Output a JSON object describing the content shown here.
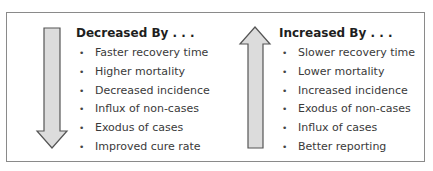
{
  "diagram": {
    "left_panel": {
      "arrow": "down-arrow",
      "heading": "Decreased By . . .",
      "items": [
        "Faster recovery time",
        "Higher mortality",
        "Decreased incidence",
        "Influx of non-cases",
        "Exodus of cases",
        "Improved cure rate"
      ]
    },
    "right_panel": {
      "arrow": "up-arrow",
      "heading": "Increased By . . .",
      "items": [
        "Slower recovery time",
        "Lower mortality",
        "Increased incidence",
        "Exodus of non-cases",
        "Influx of cases",
        "Better reporting"
      ]
    },
    "colors": {
      "arrow_fill": "#dcdcdc",
      "arrow_stroke": "#555555",
      "frame_border": "#8a8a8a"
    },
    "bullet_glyph": "•"
  }
}
